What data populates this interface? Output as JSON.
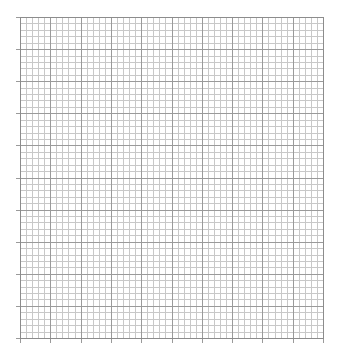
{
  "graph_paper": {
    "background": "#ffffff",
    "minor_color": "#c8c8c8",
    "major_color": "#9a9a9a",
    "border_color": "#8c8c8c",
    "left": 20,
    "top": 17,
    "width": 303,
    "height": 321,
    "major_cols": 10,
    "major_rows": 10,
    "minor_per_major": 5,
    "tick_length": 5
  }
}
